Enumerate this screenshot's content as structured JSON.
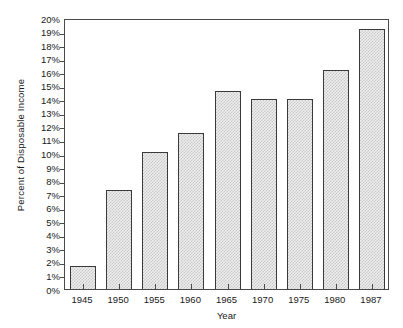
{
  "chart_data": {
    "type": "bar",
    "title": "",
    "xlabel": "Year",
    "ylabel": "Percent of Disposable Income",
    "categories": [
      "1945",
      "1950",
      "1955",
      "1960",
      "1965",
      "1970",
      "1975",
      "1980",
      "1987"
    ],
    "values": [
      1.7,
      7.3,
      10.1,
      11.5,
      14.6,
      14.0,
      14.0,
      16.2,
      19.2
    ],
    "ylim": [
      0,
      20
    ],
    "ytick_step": 1,
    "ytick_labels": [
      "0%",
      "1%",
      "2%",
      "3%",
      "4%",
      "5%",
      "6%",
      "7%",
      "8%",
      "9%",
      "10%",
      "11%",
      "12%",
      "13%",
      "14%",
      "15%",
      "16%",
      "17%",
      "18%",
      "19%",
      "20%"
    ],
    "ytick_values": [
      0,
      1,
      2,
      3,
      4,
      5,
      6,
      7,
      8,
      9,
      10,
      11,
      12,
      13,
      14,
      15,
      16,
      17,
      18,
      19,
      20
    ],
    "grid": false,
    "legend": null,
    "legend_position": "none",
    "bar_fill": "#ededed",
    "bar_hatch_color": "#c9c9c9",
    "bar_border_color": "#3a3a3a",
    "axis_color": "#4a4a4a",
    "text_color": "#1a1a1a",
    "background": "#ffffff"
  }
}
